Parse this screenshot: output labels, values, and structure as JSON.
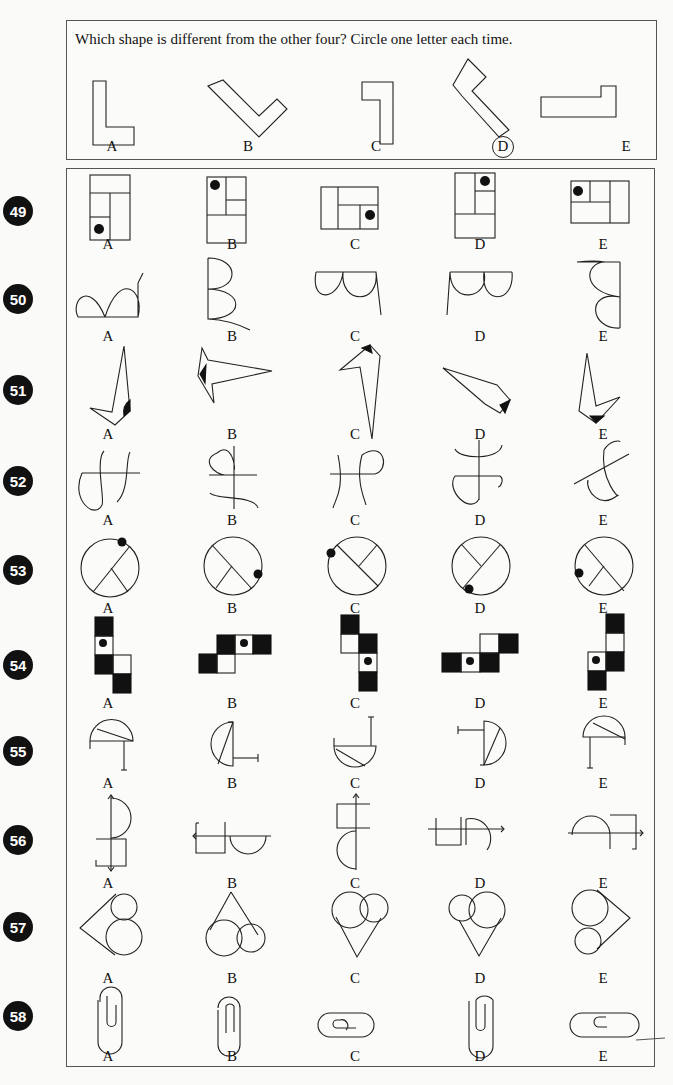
{
  "example": {
    "instruction": "Which shape is different from the other four? Circle one letter each time.",
    "options": [
      "A",
      "B",
      "C",
      "D",
      "E"
    ],
    "circled": "D"
  },
  "questions": [
    {
      "number": "49",
      "options": [
        "A",
        "B",
        "C",
        "D",
        "E"
      ],
      "figure": "rectangles-with-dot"
    },
    {
      "number": "50",
      "options": [
        "A",
        "B",
        "C",
        "D",
        "E"
      ],
      "figure": "double-loops"
    },
    {
      "number": "51",
      "options": [
        "A",
        "B",
        "C",
        "D",
        "E"
      ],
      "figure": "arrow-shapes-with-dot"
    },
    {
      "number": "52",
      "options": [
        "A",
        "B",
        "C",
        "D",
        "E"
      ],
      "figure": "curly-crosses"
    },
    {
      "number": "53",
      "options": [
        "A",
        "B",
        "C",
        "D",
        "E"
      ],
      "figure": "circles-with-lines-and-dot"
    },
    {
      "number": "54",
      "options": [
        "A",
        "B",
        "C",
        "D",
        "E"
      ],
      "figure": "black-white-squares"
    },
    {
      "number": "55",
      "options": [
        "A",
        "B",
        "C",
        "D",
        "E"
      ],
      "figure": "half-circles-with-stick"
    },
    {
      "number": "56",
      "options": [
        "A",
        "B",
        "C",
        "D",
        "E"
      ],
      "figure": "square-semicircle-arrow"
    },
    {
      "number": "57",
      "options": [
        "A",
        "B",
        "C",
        "D",
        "E"
      ],
      "figure": "circles-with-triangle"
    },
    {
      "number": "58",
      "options": [
        "A",
        "B",
        "C",
        "D",
        "E"
      ],
      "figure": "paper-clips"
    }
  ]
}
